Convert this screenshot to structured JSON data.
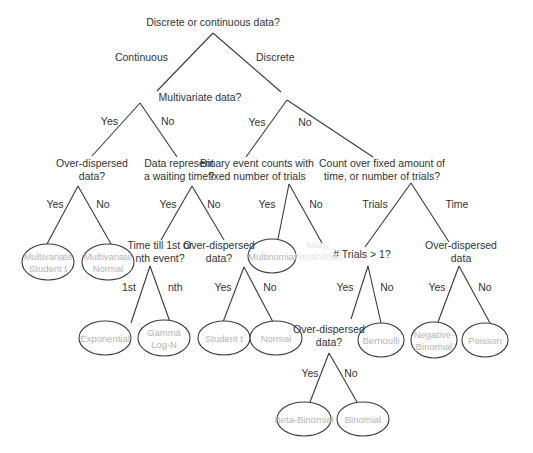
{
  "diagram": {
    "colors": {
      "line": "#3a3a3a",
      "question_text": "#333333",
      "leaf_text": "#b4b4b4",
      "faded_text": "#e4e4e4",
      "background": "#ffffff"
    },
    "questions": [
      {
        "id": "q_root",
        "lines": [
          "Discrete or continuous data?"
        ],
        "x": 213,
        "y": 26
      },
      {
        "id": "q_multivariate",
        "lines": [
          "Multivariate data?"
        ],
        "x": 200,
        "y": 101
      },
      {
        "id": "q_overdispersed_mv",
        "lines": [
          "Over-dispersed",
          "data?"
        ],
        "x": 92,
        "y": 167
      },
      {
        "id": "q_waiting_time",
        "lines": [
          "Data represent",
          "a waiting time?"
        ],
        "x": 179,
        "y": 167
      },
      {
        "id": "q_binary_counts",
        "lines": [
          "Binary event counts with",
          "fixed number of trials"
        ],
        "x": 257,
        "y": 167
      },
      {
        "id": "q_count_fixed",
        "lines": [
          "Count over fixed amount of",
          "time, or number of trials?"
        ],
        "x": 382,
        "y": 167
      },
      {
        "id": "q_time_till",
        "lines": [
          "Time till 1st or",
          "nth event?"
        ],
        "x": 160,
        "y": 249
      },
      {
        "id": "q_overdispersed_wait",
        "lines": [
          "Over-dispersed",
          "data?"
        ],
        "x": 219,
        "y": 249
      },
      {
        "id": "q_trials_gt1",
        "lines": [
          "# Trials > 1?"
        ],
        "x": 362,
        "y": 258
      },
      {
        "id": "q_overdispersed_time",
        "lines": [
          "Over-dispersed",
          "data"
        ],
        "x": 461,
        "y": 249
      },
      {
        "id": "q_overdispersed_trials",
        "lines": [
          "Over-dispersed",
          "data?"
        ],
        "x": 329,
        "y": 333
      }
    ],
    "leaves": [
      {
        "id": "leaf_mv_student_t",
        "lines": [
          "Multivariate",
          "Student t"
        ],
        "cx": 48,
        "cy": 262,
        "rx": 26,
        "ry": 18
      },
      {
        "id": "leaf_mv_normal",
        "lines": [
          "Multivariate",
          "Normal"
        ],
        "cx": 108,
        "cy": 262,
        "rx": 26,
        "ry": 18
      },
      {
        "id": "leaf_multinomial",
        "lines": [
          "Multinomial"
        ],
        "cx": 272,
        "cy": 256,
        "rx": 24,
        "ry": 17
      },
      {
        "id": "leaf_exponential",
        "lines": [
          "Exponential"
        ],
        "cx": 105,
        "cy": 338,
        "rx": 26,
        "ry": 17
      },
      {
        "id": "leaf_gamma_logn",
        "lines": [
          "Gamma",
          "Log-N"
        ],
        "cx": 164,
        "cy": 338,
        "rx": 26,
        "ry": 18
      },
      {
        "id": "leaf_student_t",
        "lines": [
          "Student t"
        ],
        "cx": 224,
        "cy": 338,
        "rx": 26,
        "ry": 17
      },
      {
        "id": "leaf_normal",
        "lines": [
          "Normal"
        ],
        "cx": 276,
        "cy": 338,
        "rx": 26,
        "ry": 17
      },
      {
        "id": "leaf_bernoulli",
        "lines": [
          "Bernoulli"
        ],
        "cx": 381,
        "cy": 340,
        "rx": 23,
        "ry": 17
      },
      {
        "id": "leaf_negative_binomial",
        "lines": [
          "Negative-",
          "Binomial"
        ],
        "cx": 434,
        "cy": 340,
        "rx": 23,
        "ry": 18
      },
      {
        "id": "leaf_poisson",
        "lines": [
          "Poisson"
        ],
        "cx": 485,
        "cy": 340,
        "rx": 23,
        "ry": 17
      },
      {
        "id": "leaf_beta_binomial",
        "lines": [
          "Beta-Binomial"
        ],
        "cx": 304,
        "cy": 419,
        "rx": 27,
        "ry": 17
      },
      {
        "id": "leaf_binomial",
        "lines": [
          "Binomial"
        ],
        "cx": 363,
        "cy": 419,
        "rx": 26,
        "ry": 17
      }
    ],
    "faded_leaves": [
      {
        "id": "leaf_many_possibilities",
        "lines": [
          "Many",
          "Possibilities"
        ],
        "x": 318,
        "y": 254
      }
    ],
    "edges": [
      {
        "id": "e_root_continuous",
        "x1": 213,
        "y1": 33,
        "x2": 157,
        "y2": 91,
        "label": "Continuous",
        "lx": 168,
        "ly": 61,
        "anchor": "end"
      },
      {
        "id": "e_root_discrete",
        "x1": 213,
        "y1": 33,
        "x2": 281,
        "y2": 92,
        "label": "Discrete",
        "lx": 256,
        "ly": 61,
        "anchor": "start"
      },
      {
        "id": "e_mv_yes",
        "x1": 140,
        "y1": 103,
        "x2": 92,
        "y2": 156,
        "label": "Yes",
        "lx": 118,
        "ly": 125,
        "anchor": "end"
      },
      {
        "id": "e_mv_no",
        "x1": 140,
        "y1": 103,
        "x2": 177,
        "y2": 157,
        "label": "No",
        "lx": 161,
        "ly": 125,
        "anchor": "start"
      },
      {
        "id": "e_disc_yes",
        "x1": 287,
        "y1": 100,
        "x2": 246,
        "y2": 157,
        "label": "Yes",
        "lx": 257,
        "ly": 126,
        "anchor": "middle"
      },
      {
        "id": "e_disc_no",
        "x1": 287,
        "y1": 100,
        "x2": 373,
        "y2": 157,
        "label": "No",
        "lx": 305,
        "ly": 126,
        "anchor": "middle"
      },
      {
        "id": "e_odmv_yes",
        "x1": 78,
        "y1": 186,
        "x2": 47,
        "y2": 244,
        "label": "Yes",
        "lx": 55,
        "ly": 208,
        "anchor": "middle"
      },
      {
        "id": "e_odmv_no",
        "x1": 78,
        "y1": 186,
        "x2": 111,
        "y2": 244,
        "label": "No",
        "lx": 103,
        "ly": 208,
        "anchor": "middle"
      },
      {
        "id": "e_wait_yes",
        "x1": 192,
        "y1": 186,
        "x2": 161,
        "y2": 240,
        "label": "Yes",
        "lx": 168,
        "ly": 208,
        "anchor": "middle"
      },
      {
        "id": "e_wait_no",
        "x1": 192,
        "y1": 186,
        "x2": 224,
        "y2": 240,
        "label": "No",
        "lx": 214,
        "ly": 208,
        "anchor": "middle"
      },
      {
        "id": "e_bin_yes",
        "x1": 289,
        "y1": 184,
        "x2": 278,
        "y2": 239,
        "label": "Yes",
        "lx": 267,
        "ly": 208,
        "anchor": "middle"
      },
      {
        "id": "e_bin_no",
        "x1": 289,
        "y1": 184,
        "x2": 322,
        "y2": 243,
        "label": "No",
        "lx": 316,
        "ly": 208,
        "anchor": "middle"
      },
      {
        "id": "e_cnt_trials",
        "x1": 411,
        "y1": 183,
        "x2": 365,
        "y2": 247,
        "label": "Trials",
        "lx": 375,
        "ly": 208,
        "anchor": "middle"
      },
      {
        "id": "e_cnt_time",
        "x1": 411,
        "y1": 183,
        "x2": 449,
        "y2": 242,
        "label": "Time",
        "lx": 457,
        "ly": 208,
        "anchor": "middle"
      },
      {
        "id": "e_tt_1st",
        "x1": 150,
        "y1": 266,
        "x2": 131,
        "y2": 323,
        "label": "1st",
        "lx": 136,
        "ly": 291,
        "anchor": "end"
      },
      {
        "id": "e_tt_nth",
        "x1": 150,
        "y1": 266,
        "x2": 170,
        "y2": 322,
        "label": "nth",
        "lx": 168,
        "ly": 291,
        "anchor": "start"
      },
      {
        "id": "e_odw_yes",
        "x1": 244,
        "y1": 267,
        "x2": 223,
        "y2": 322,
        "label": "Yes",
        "lx": 223,
        "ly": 291,
        "anchor": "middle"
      },
      {
        "id": "e_odw_no",
        "x1": 244,
        "y1": 267,
        "x2": 273,
        "y2": 322,
        "label": "No",
        "lx": 270,
        "ly": 291,
        "anchor": "middle"
      },
      {
        "id": "e_tr_yes",
        "x1": 368,
        "y1": 266,
        "x2": 351,
        "y2": 319,
        "label": "Yes",
        "lx": 345,
        "ly": 291,
        "anchor": "middle"
      },
      {
        "id": "e_tr_no",
        "x1": 368,
        "y1": 266,
        "x2": 381,
        "y2": 323,
        "label": "No",
        "lx": 387,
        "ly": 291,
        "anchor": "middle"
      },
      {
        "id": "e_odt_yes",
        "x1": 459,
        "y1": 266,
        "x2": 438,
        "y2": 322,
        "label": "Yes",
        "lx": 437,
        "ly": 291,
        "anchor": "middle"
      },
      {
        "id": "e_odt_no",
        "x1": 459,
        "y1": 266,
        "x2": 490,
        "y2": 323,
        "label": "No",
        "lx": 485,
        "ly": 291,
        "anchor": "middle"
      },
      {
        "id": "e_odtr_yes",
        "x1": 329,
        "y1": 353,
        "x2": 310,
        "y2": 402,
        "label": "Yes",
        "lx": 310,
        "ly": 377,
        "anchor": "middle"
      },
      {
        "id": "e_odtr_no",
        "x1": 329,
        "y1": 353,
        "x2": 357,
        "y2": 402,
        "label": "No",
        "lx": 351,
        "ly": 377,
        "anchor": "middle"
      }
    ]
  }
}
